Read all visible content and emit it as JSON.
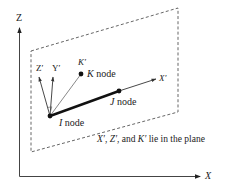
{
  "diagram": {
    "type": "3d-coordinate-frame",
    "global_axes": {
      "z_label": "Z",
      "x_label": "X"
    },
    "local_axes": {
      "x_prime_label": "X′",
      "y_prime_label": "Y′",
      "z_prime_label": "Z′",
      "k_prime_label": "K′"
    },
    "nodes": {
      "i_letter": "I",
      "i_suffix": " node",
      "j_letter": "J",
      "j_suffix": " node",
      "k_letter": "K",
      "k_suffix": " node"
    },
    "caption": {
      "x": "X′",
      "sep1": ", ",
      "z": "Z′",
      "sep2": ", and ",
      "k": "K′",
      "tail": " lie in the plane"
    },
    "colors": {
      "line": "#222222",
      "axis": "#444444",
      "dash": "#555555",
      "background": "#ffffff"
    }
  }
}
